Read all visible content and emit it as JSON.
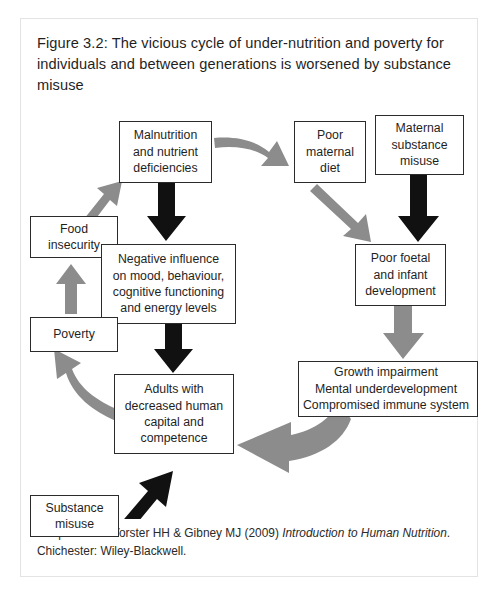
{
  "figure": {
    "title": "Figure 3.2: The vicious cycle of under-nutrition and poverty for individuals and between generations is worsened by substance misuse",
    "caption_part1": "Adapted from Vorster HH & Gibney MJ (2009) ",
    "caption_italic1": "Introduction to Human Nutrition",
    "caption_part2": ". Chichester: Wiley-Blackwell.",
    "frame_border_color": "#e3e3e3"
  },
  "diagram": {
    "type": "cycle-flow-diagram",
    "node_border_color": "#2b2b2b",
    "gray_arrow_color": "#8c8c8c",
    "black_arrow_color": "#111111",
    "nodes": [
      {
        "id": "malnutrition",
        "label": "Malnutrition\nand nutrient\ndeficiencies"
      },
      {
        "id": "poor-maternal",
        "label": "Poor\nmaternal\ndiet"
      },
      {
        "id": "maternal-subst",
        "label": "Maternal\nsubstance\nmisuse"
      },
      {
        "id": "food-insecurity",
        "label": "Food\ninsecurity"
      },
      {
        "id": "negative-infl",
        "label": "Negative influence\non mood, behaviour,\ncognitive functioning\nand energy levels"
      },
      {
        "id": "poor-foetal",
        "label": "Poor foetal\nand infant\ndevelopment"
      },
      {
        "id": "poverty",
        "label": "Poverty"
      },
      {
        "id": "growth-impairment",
        "label": "Growth impairment\nMental underdevelopment\nCompromised immune system"
      },
      {
        "id": "adults",
        "label": "Adults with\ndecreased human\ncapital and\ncompetence"
      },
      {
        "id": "substance-misuse",
        "label": "Substance\nmisuse"
      }
    ],
    "edges": [
      {
        "from": "malnutrition",
        "to": "poor-maternal",
        "style": "gray-curved"
      },
      {
        "from": "malnutrition",
        "to": "negative-infl",
        "style": "black-straight"
      },
      {
        "from": "poor-maternal",
        "to": "poor-foetal",
        "style": "gray-straight"
      },
      {
        "from": "maternal-subst",
        "to": "poor-foetal",
        "style": "black-straight"
      },
      {
        "from": "poor-foetal",
        "to": "growth-impairment",
        "style": "gray-straight"
      },
      {
        "from": "growth-impairment",
        "to": "adults",
        "style": "gray-curved"
      },
      {
        "from": "negative-infl",
        "to": "adults",
        "style": "black-straight"
      },
      {
        "from": "adults",
        "to": "poverty",
        "style": "gray-curved"
      },
      {
        "from": "poverty",
        "to": "food-insecurity",
        "style": "gray-straight"
      },
      {
        "from": "food-insecurity",
        "to": "malnutrition",
        "style": "gray-straight"
      },
      {
        "from": "substance-misuse",
        "to": "adults",
        "style": "black-straight"
      }
    ]
  }
}
